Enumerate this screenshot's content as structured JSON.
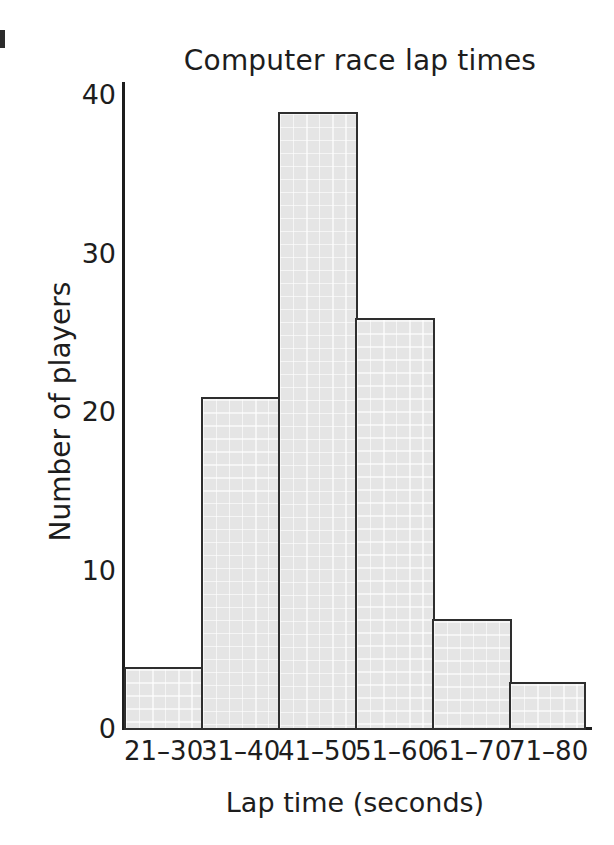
{
  "chart_data": {
    "type": "bar",
    "title": "Computer race lap times",
    "xlabel": "Lap time (seconds)",
    "ylabel": "Number of players",
    "categories": [
      "21–30",
      "31–40",
      "41–50",
      "51–60",
      "61–70",
      "71–80"
    ],
    "values": [
      4,
      21,
      39,
      26,
      7,
      3
    ],
    "ylim": [
      0,
      40
    ],
    "yticks": [
      0,
      10,
      20,
      30,
      40
    ],
    "ytick_labels": [
      "0",
      "10",
      "20",
      "30",
      "40"
    ],
    "grid": false,
    "legend": null,
    "bar_fill_color": "#e5e5e5",
    "bar_edge_color": "#2e2e2e",
    "axis_color": "#1d1d1d",
    "background_color": "#ffffff"
  }
}
